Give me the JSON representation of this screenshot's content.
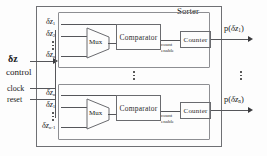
{
  "diagram": {
    "title": "Sorter",
    "inputs": {
      "data_label": "δz",
      "data_sub": "",
      "control_label": "control",
      "clock_label": "clock",
      "reset_label": "reset"
    },
    "blocks": {
      "mux_label": "Mux",
      "comparator_label": "Comparator",
      "counter_label": "Counter",
      "count_enable_line1": "count",
      "count_enable_line2": "enable"
    },
    "channels": [
      {
        "id": "channel-1",
        "mux_inputs": [
          {
            "base": "δz",
            "sub": "1"
          },
          {
            "base": "δz",
            "sub": "2"
          },
          {
            "base": "δz",
            "sub": "n"
          }
        ],
        "output": {
          "prefix": "p(",
          "base": "δz",
          "sub": "1",
          "suffix": ")"
        }
      },
      {
        "id": "channel-n",
        "mux_inputs": [
          {
            "base": "δz",
            "sub": "n"
          },
          {
            "base": "δz",
            "sub": "1"
          },
          {
            "base": "δz",
            "sub": "n-1"
          }
        ],
        "output": {
          "prefix": "p(",
          "base": "δz",
          "sub": "n",
          "suffix": ")"
        }
      }
    ],
    "ellipsis": {
      "mux_vertical": "⋮",
      "channel_vertical": "⋮"
    },
    "colors": {
      "line": "#55565a",
      "box_border": "#6a6b6f",
      "frame": "#6f7074",
      "text": "#202020",
      "background": "#ffffff"
    }
  }
}
